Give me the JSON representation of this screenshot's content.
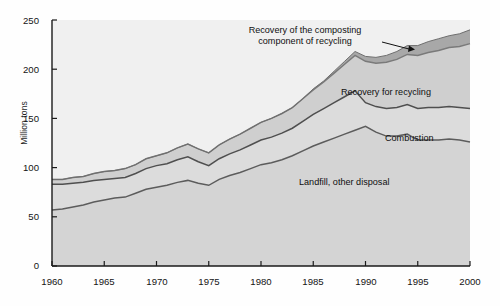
{
  "chart_data": {
    "type": "area",
    "stacked": true,
    "title": "",
    "subtitle": "",
    "xlabel": "",
    "ylabel": "Million tons",
    "xlim": [
      1960,
      2000
    ],
    "ylim": [
      0,
      250
    ],
    "ytick_labels": [
      "0",
      "50",
      "100",
      "150",
      "200",
      "250"
    ],
    "ytick_values": [
      0,
      50,
      100,
      150,
      200,
      250
    ],
    "xtick_labels": [
      "1960",
      "1965",
      "1970",
      "1975",
      "1980",
      "1985",
      "1990",
      "1995",
      "2000"
    ],
    "xtick_values": [
      1960,
      1965,
      1970,
      1975,
      1980,
      1985,
      1990,
      1995,
      2000
    ],
    "grid": false,
    "legend_position": "inline-annotations",
    "x": [
      1960,
      1961,
      1962,
      1963,
      1964,
      1965,
      1966,
      1967,
      1968,
      1969,
      1970,
      1971,
      1972,
      1973,
      1974,
      1975,
      1976,
      1977,
      1978,
      1979,
      1980,
      1981,
      1982,
      1983,
      1984,
      1985,
      1986,
      1987,
      1988,
      1989,
      1990,
      1991,
      1992,
      1993,
      1994,
      1995,
      1996,
      1997,
      1998,
      1999,
      2000
    ],
    "series": [
      {
        "name": "Landfill, other disposal",
        "color": "#d4d4d4",
        "line_color": "#5c5c5c",
        "values": [
          57,
          58,
          60,
          62,
          65,
          67,
          69,
          70,
          74,
          78,
          80,
          82,
          85,
          87,
          84,
          82,
          88,
          92,
          95,
          99,
          103,
          105,
          108,
          112,
          117,
          122,
          126,
          130,
          134,
          138,
          142,
          136,
          132,
          132,
          134,
          128,
          128,
          128,
          129,
          128,
          126
        ]
      },
      {
        "name": "Combustion",
        "color": "#dcdcdc",
        "line_color": "#4f4f4f",
        "values": [
          26,
          25,
          24,
          23,
          22,
          21,
          20,
          20,
          20,
          21,
          22,
          22,
          23,
          24,
          22,
          20,
          21,
          22,
          23,
          24,
          25,
          26,
          27,
          28,
          30,
          32,
          34,
          36,
          38,
          40,
          24,
          26,
          28,
          29,
          30,
          32,
          33,
          33,
          33,
          33,
          34
        ]
      },
      {
        "name": "Recovery for recycling",
        "color": "#cfcfcf",
        "line_color": "#7a7a7a",
        "values": [
          5,
          5,
          6,
          6,
          7,
          8,
          8,
          9,
          9,
          10,
          10,
          11,
          12,
          13,
          13,
          13,
          14,
          15,
          16,
          17,
          18,
          19,
          20,
          21,
          23,
          25,
          27,
          30,
          33,
          36,
          42,
          44,
          47,
          49,
          51,
          54,
          56,
          58,
          60,
          62,
          66
        ]
      },
      {
        "name": "Recovery of the composting component of recycling",
        "color": "#a8a8a8",
        "line_color": "#6e6e6e",
        "values": [
          0,
          0,
          0,
          0,
          0,
          0,
          0,
          0,
          0,
          0,
          0,
          0,
          0,
          0,
          0,
          0,
          0,
          0,
          0,
          0,
          0,
          0,
          0,
          0,
          0,
          1,
          1,
          2,
          3,
          4,
          5,
          6,
          7,
          8,
          9,
          10,
          11,
          12,
          12,
          13,
          14
        ]
      }
    ],
    "cumulative_totals": [
      88,
      88,
      90,
      91,
      94,
      96,
      97,
      99,
      103,
      109,
      112,
      115,
      120,
      124,
      119,
      115,
      123,
      129,
      134,
      140,
      146,
      150,
      155,
      161,
      170,
      180,
      188,
      198,
      208,
      218,
      213,
      212,
      214,
      218,
      224,
      224,
      228,
      231,
      234,
      236,
      240
    ],
    "annotations": [
      {
        "name": "composting-annotation",
        "line1": "Recovery of the composting",
        "line2": "component of recycling",
        "has_leader_arrow": true
      },
      {
        "name": "recycling-annotation",
        "text": "Recovery for recycling"
      },
      {
        "name": "combustion-annotation",
        "text": "Combustion"
      },
      {
        "name": "landfill-annotation",
        "text": "Landfill, other disposal"
      }
    ]
  },
  "axes": {
    "y_axis_title": "Million tons",
    "y_ticks": [
      "250",
      "200",
      "150",
      "100",
      "50",
      "0"
    ],
    "x_ticks": [
      "1960",
      "1965",
      "1970",
      "1975",
      "1980",
      "1985",
      "1990",
      "1995",
      "2000"
    ]
  },
  "labels": {
    "composting_l1": "Recovery of the composting",
    "composting_l2": "component of recycling",
    "recycling": "Recovery for recycling",
    "combustion": "Combustion",
    "landfill": "Landfill, other disposal"
  },
  "colors": {
    "plot_background": "#ebebeb",
    "above_curve_background": "#f0f0f0",
    "landfill_fill": "#d4d4d4",
    "combustion_fill": "#dcdcdc",
    "recycling_fill": "#cfcfcf",
    "composting_fill": "#a8a8a8",
    "axis": "#1a1a1a",
    "text": "#141414"
  }
}
